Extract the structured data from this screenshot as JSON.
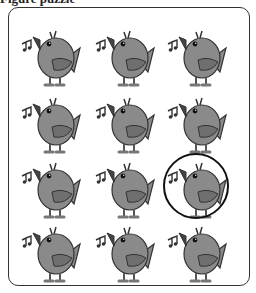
{
  "caption": "Figure puzzle",
  "grid": {
    "rows": 4,
    "cols": 3
  },
  "birds": [
    {
      "row": 1,
      "col": 1
    },
    {
      "row": 1,
      "col": 2
    },
    {
      "row": 1,
      "col": 3
    },
    {
      "row": 2,
      "col": 1
    },
    {
      "row": 2,
      "col": 2
    },
    {
      "row": 2,
      "col": 3
    },
    {
      "row": 3,
      "col": 1
    },
    {
      "row": 3,
      "col": 2
    },
    {
      "row": 3,
      "col": 3,
      "highlighted": true
    },
    {
      "row": 4,
      "col": 1
    },
    {
      "row": 4,
      "col": 2
    },
    {
      "row": 4,
      "col": 3
    }
  ],
  "colors": {
    "body": "#8a8a8a",
    "wing": "#6f6f6f",
    "outline": "#333333",
    "highlight": "#111111"
  }
}
